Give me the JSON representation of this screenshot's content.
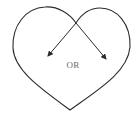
{
  "diagram": {
    "shape": "heart",
    "label": "OR",
    "arrows": [
      {
        "name": "left-arrow",
        "direction": "down-left"
      },
      {
        "name": "right-arrow",
        "direction": "down-right"
      }
    ],
    "colors": {
      "stroke": "#2a2a2a",
      "label": "#6a6a6a",
      "background": "#ffffff"
    }
  }
}
